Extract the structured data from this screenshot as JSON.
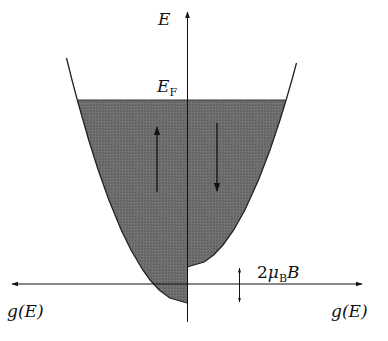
{
  "diagram": {
    "labels": {
      "energy_axis": "E",
      "fermi_level_main": "E",
      "fermi_level_sub": "F",
      "left_axis": "g(E)",
      "right_axis": "g(E)",
      "splitting_prefix": "2",
      "splitting_mu": "μ",
      "splitting_sub": "B",
      "splitting_field": "B"
    },
    "bands": [
      {
        "name": "spin-up",
        "side": "left",
        "arrow": "up"
      },
      {
        "name": "spin-down",
        "side": "right",
        "arrow": "down"
      }
    ],
    "colors": {
      "fill": "#6b6b6b",
      "line": "#111111",
      "background": "#ffffff"
    }
  }
}
